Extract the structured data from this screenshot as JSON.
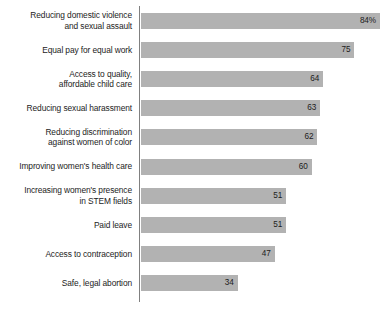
{
  "chart_data": {
    "type": "bar",
    "orientation": "horizontal",
    "title": "",
    "subtitle": "",
    "xlabel": "",
    "ylabel": "",
    "xlim": [
      0,
      89
    ],
    "grid": false,
    "legend": false,
    "bar_color": "#b2b2b2",
    "axis_color": "#808080",
    "text_color": "#1c1c1c",
    "categories": [
      "Reducing domestic violence\nand sexual assault",
      "Equal pay for equal work",
      "Access to quality,\naffordable child care",
      "Reducing sexual harassment",
      "Reducing discrimination\nagainst women of color",
      "Improving women's health care",
      "Increasing women's presence\nin STEM fields",
      "Paid leave",
      "Access to contraception",
      "Safe, legal abortion"
    ],
    "values": [
      84,
      75,
      64,
      63,
      62,
      60,
      51,
      51,
      47,
      34
    ],
    "value_labels": [
      "84%",
      "75",
      "64",
      "63",
      "62",
      "60",
      "51",
      "51",
      "47",
      "34"
    ]
  }
}
